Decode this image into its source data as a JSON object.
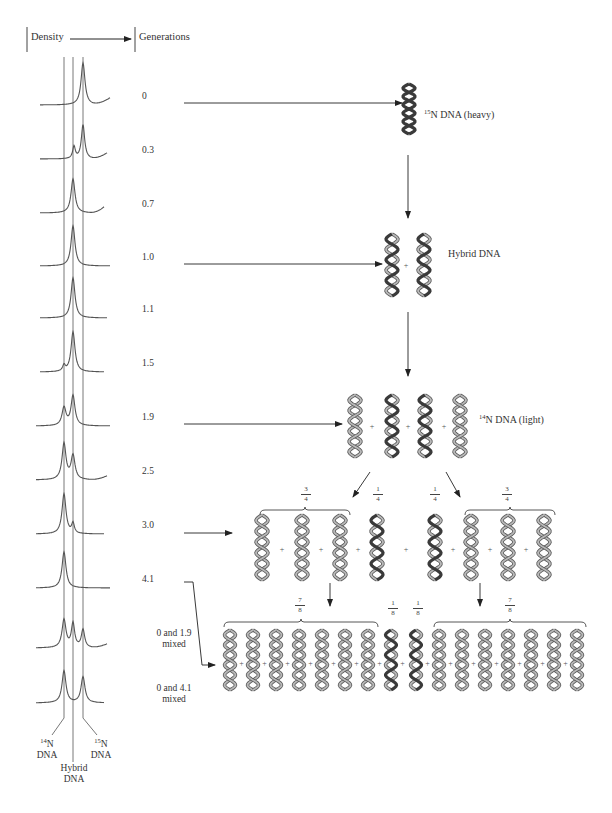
{
  "header": {
    "density_label": "Density",
    "generations_label": "Generations"
  },
  "generations": [
    {
      "label": "0",
      "profile": "heavy"
    },
    {
      "label": "0.3",
      "profile": "heavy-shoulder"
    },
    {
      "label": "0.7",
      "profile": "hybrid-tail"
    },
    {
      "label": "1.0",
      "profile": "hybrid"
    },
    {
      "label": "1.1",
      "profile": "hybrid"
    },
    {
      "label": "1.5",
      "profile": "hybrid-light-shoulder"
    },
    {
      "label": "1.9",
      "profile": "light-hybrid"
    },
    {
      "label": "2.5",
      "profile": "light-hybrid-light-dominant"
    },
    {
      "label": "3.0",
      "profile": "light-hybrid-shoulder"
    },
    {
      "label": "4.1",
      "profile": "light"
    },
    {
      "label": "0 and 1.9",
      "label2": "mixed",
      "profile": "three-peaks"
    },
    {
      "label": "0 and 4.1",
      "label2": "mixed",
      "profile": "light-heavy"
    }
  ],
  "band_labels": {
    "n14": {
      "sup": "14",
      "text": "N",
      "line2": "DNA"
    },
    "hybrid": {
      "line1": "Hybrid",
      "line2": "DNA"
    },
    "n15": {
      "sup": "15",
      "text": "N",
      "line2": "DNA"
    }
  },
  "stages": {
    "heavy": {
      "sup": "15",
      "text": "N DNA (heavy)"
    },
    "hybrid": {
      "text": "Hybrid DNA"
    },
    "light": {
      "sup": "14",
      "text": "N DNA (light)"
    }
  },
  "fractions": {
    "gen3_left": {
      "num": "3",
      "den": "4"
    },
    "gen3_mid_left": {
      "num": "1",
      "den": "4"
    },
    "gen3_mid_right": {
      "num": "1",
      "den": "4"
    },
    "gen3_right": {
      "num": "3",
      "den": "4"
    },
    "gen4_left": {
      "num": "7",
      "den": "8"
    },
    "gen4_mid_left": {
      "num": "1",
      "den": "8"
    },
    "gen4_mid_right": {
      "num": "1",
      "den": "8"
    },
    "gen4_right": {
      "num": "7",
      "den": "8"
    }
  },
  "plus_sign": "+",
  "colors": {
    "ink": "#333333",
    "heavy_strand": "#3a3a3a",
    "light_strand": "#8a8a8a",
    "light_outline": "#6a6a6a",
    "curve": "#555555"
  }
}
